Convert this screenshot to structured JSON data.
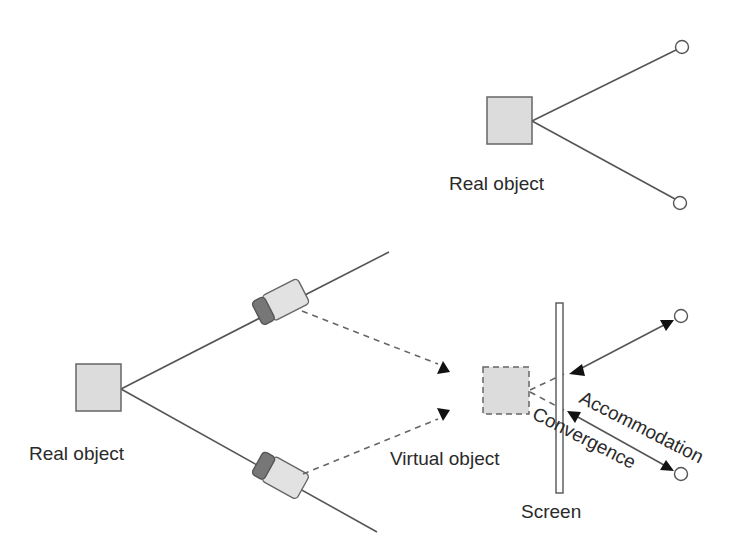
{
  "diagram": {
    "top_scene": {
      "real_object_label": "Real object"
    },
    "bottom_scene": {
      "real_object_label": "Real object",
      "virtual_object_label": "Virtual object",
      "screen_label": "Screen",
      "accommodation_label": "Accommodation",
      "convergence_label": "Convergence"
    },
    "colors": {
      "object_fill": "#dcdcdc",
      "camera_lens": "#777777",
      "camera_body": "#e2e2e2",
      "line": "#555555",
      "arrowhead": "#111111"
    }
  }
}
